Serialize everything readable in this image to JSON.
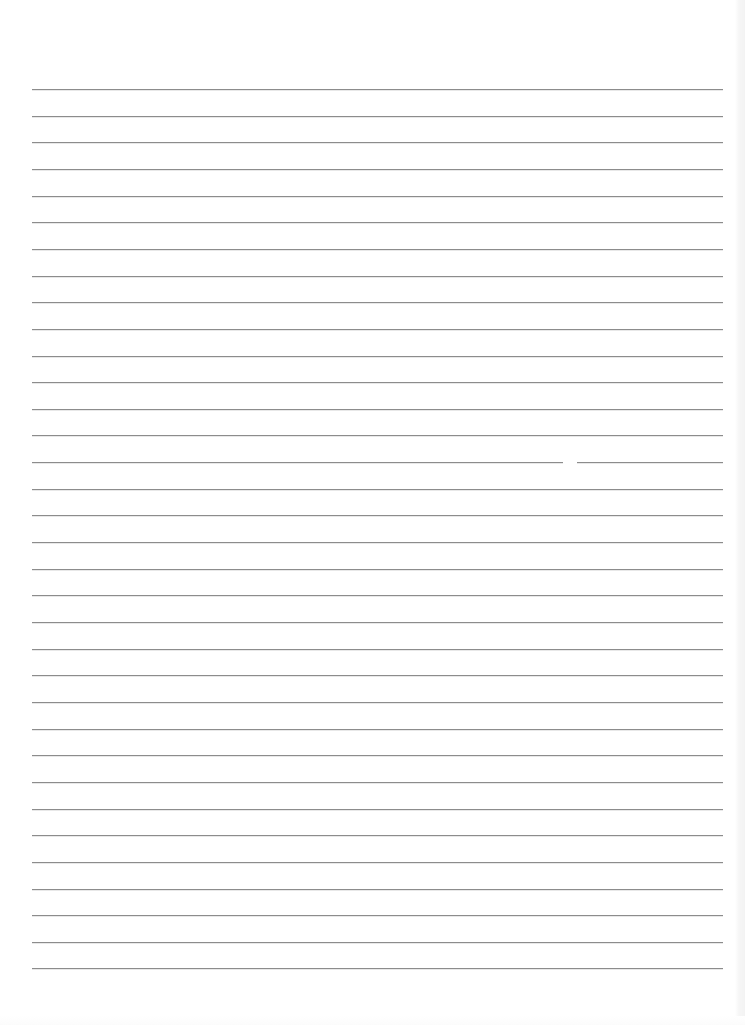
{
  "document": {
    "type": "lined-paper",
    "text": "",
    "rules": {
      "count": 34,
      "first_y": 89,
      "spacing": 26.65,
      "left_x": 32,
      "right_x": 723,
      "color": "#8c8c8c"
    },
    "background_color": "#ffffff",
    "scan_gap": {
      "rule_index": 14,
      "x": 563,
      "width": 14
    }
  }
}
